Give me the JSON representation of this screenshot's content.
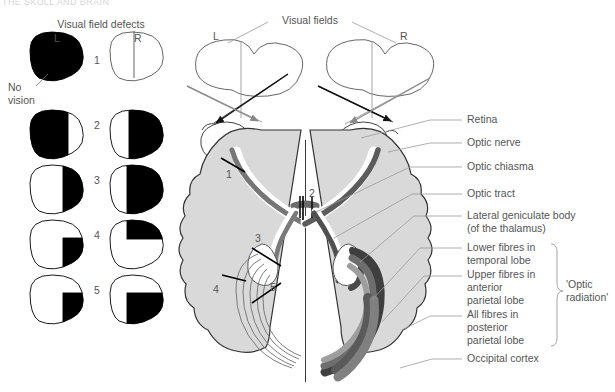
{
  "figure": {
    "top_cut_text": "THE SKULL AND BRAIN",
    "defects_heading": "Visual field defects",
    "defects_col_left": "L",
    "defects_col_right": "R",
    "no_vision_label": "No\nvision",
    "visual_fields_heading": "Visual fields",
    "visual_fields_left": "L",
    "visual_fields_right": "R",
    "optic_radiation_bracket": "'Optic\nradiation'"
  },
  "defect_rows": [
    {
      "number": "1",
      "left_pattern": "full-black",
      "right_pattern": "white-with-midline",
      "note": "No vision left eye"
    },
    {
      "number": "2",
      "left_pattern": "left-black",
      "right_pattern": "right-black",
      "note": "Bitemporal hemianopia"
    },
    {
      "number": "3",
      "left_pattern": "right-black",
      "right_pattern": "right-black",
      "note": "Homonymous hemianopia"
    },
    {
      "number": "4",
      "left_pattern": "lower-right-quadrant-black",
      "right_pattern": "upper-left-quadrant-black",
      "note": "Quadrantanopia"
    },
    {
      "number": "5",
      "left_pattern": "lower-right-quadrant-black",
      "right_pattern": "lower-left-half-black",
      "note": "Quadrantanopia / macular sparing"
    }
  ],
  "brain_markers": [
    {
      "id": "1",
      "target": "optic nerve lesion"
    },
    {
      "id": "2",
      "target": "optic chiasma lesion"
    },
    {
      "id": "3",
      "target": "optic tract / lateral geniculate lesion"
    },
    {
      "id": "4",
      "target": "temporal lobe fibres lesion"
    },
    {
      "id": "5",
      "target": "parietal lobe fibres lesion"
    }
  ],
  "anatomy_labels": [
    {
      "text": "Retina",
      "y": 120
    },
    {
      "text": "Optic nerve",
      "y": 143
    },
    {
      "text": "Optic chiasma",
      "y": 167
    },
    {
      "text": "Optic tract",
      "y": 194
    },
    {
      "text": "Lateral geniculate body\n(of the thalamus)",
      "y": 216
    },
    {
      "text": "Lower fibres in\ntemporal lobe",
      "y": 248
    },
    {
      "text": "Upper fibres in\nanterior\nparietal lobe",
      "y": 275
    },
    {
      "text": "All fibres in\nposterior\nparietal lobe",
      "y": 315
    },
    {
      "text": "Occipital cortex",
      "y": 359
    }
  ],
  "colors": {
    "ink": "#4a4a4a",
    "outline": "#3a3a3a",
    "black_fill": "#000000",
    "brain_fill": "#d9d9d9",
    "tract_mid": "#8a8a8a",
    "tract_dark": "#5f5f5f",
    "white": "#ffffff",
    "leader": "#9a9a9a"
  }
}
